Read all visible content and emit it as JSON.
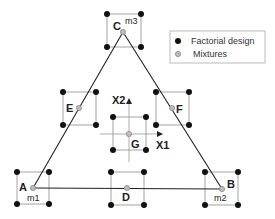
{
  "legend": {
    "items": [
      {
        "label": "Factorial design",
        "marker": "filled-black-dot"
      },
      {
        "label": "Mixtures",
        "marker": "gray-hatched-dot"
      }
    ]
  },
  "colors": {
    "line": "#222222",
    "box": "#999999",
    "factorial_dot": "#111111",
    "mixture_dot": "#a8a8a8",
    "legend_border": "#aaaaaa"
  },
  "triangle": {
    "vertices": {
      "A": {
        "label": "A",
        "sub": "m1"
      },
      "B": {
        "label": "B",
        "sub": "m2"
      },
      "C": {
        "label": "C",
        "sub": "m3"
      }
    }
  },
  "points": {
    "A": "A",
    "B": "B",
    "C": "C",
    "D": "D",
    "E": "E",
    "F": "F",
    "G": "G"
  },
  "axes": {
    "x1": "X1",
    "x2": "X2"
  }
}
